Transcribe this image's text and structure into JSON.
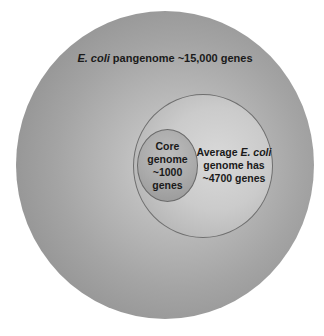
{
  "diagram": {
    "type": "nested-circles",
    "outer": {
      "label_italic": "E. coli",
      "label_rest": " pangenome ~15,000 genes",
      "color_center": "#d6d6d6",
      "color_edge": "#858585"
    },
    "middle": {
      "lines": [
        {
          "text": "Average ",
          "italic": "E. coli"
        },
        {
          "text": "genome has"
        },
        {
          "text": "~4700 genes"
        }
      ],
      "color": "#cbcbcb"
    },
    "inner": {
      "lines": [
        "Core",
        "genome",
        "~1000",
        "genes"
      ],
      "color": "#ababab"
    }
  }
}
